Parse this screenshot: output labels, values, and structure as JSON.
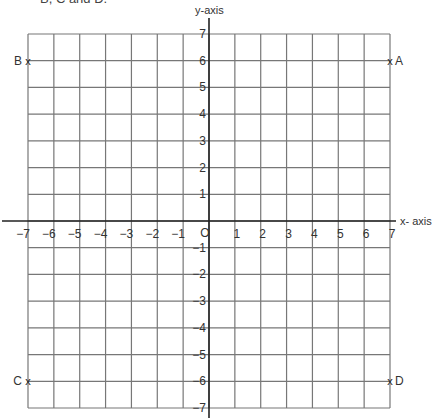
{
  "header": {
    "text": "B, C and D."
  },
  "chart_data": {
    "type": "scatter",
    "title": "",
    "xlabel": "x- axis",
    "ylabel": "y-axis",
    "xlim": [
      -7,
      7
    ],
    "ylim": [
      -7,
      7
    ],
    "grid": true,
    "x_ticks": [
      -7,
      -6,
      -5,
      -4,
      -3,
      -2,
      -1,
      0,
      1,
      2,
      3,
      4,
      5,
      6,
      7
    ],
    "y_ticks": [
      -7,
      -6,
      -5,
      -4,
      -3,
      -2,
      -1,
      1,
      2,
      3,
      4,
      5,
      6,
      7
    ],
    "origin_label": "O",
    "points": [
      {
        "label": "A",
        "x": 7,
        "y": 6
      },
      {
        "label": "B",
        "x": -7,
        "y": 6
      },
      {
        "label": "C",
        "x": -7,
        "y": -6
      },
      {
        "label": "D",
        "x": 7,
        "y": -6
      }
    ]
  },
  "colors": {
    "grid": "#777777",
    "axis": "#222222",
    "text": "#333333"
  }
}
